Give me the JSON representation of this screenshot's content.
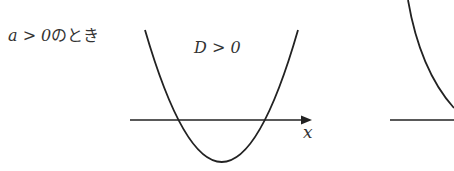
{
  "diagram": {
    "condition_label": {
      "math": "a > 0",
      "suffix": "のとき"
    },
    "case_label": "D > 0",
    "axis_label": "x",
    "stroke_color": "#222222"
  }
}
